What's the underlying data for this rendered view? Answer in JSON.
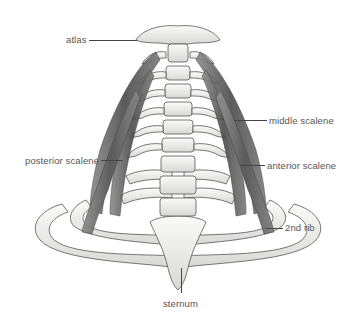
{
  "figure": {
    "colors": {
      "background": "#ffffff",
      "bone_fill": "#f2f2f0",
      "bone_shade": "#9a9a96",
      "bone_outline": "#4a4a48",
      "muscle": "#6b6b6b",
      "muscle_dark": "#3e3e3e",
      "label_text": "#555555",
      "leader_line": "#444444"
    }
  },
  "labels": {
    "atlas": "atlas",
    "middle_scalene": "middle scalene",
    "posterior_scalene": "posterior scalene",
    "anterior_scalene": "anterior scalene",
    "second_rib": "2nd rib",
    "sternum": "sternum"
  }
}
